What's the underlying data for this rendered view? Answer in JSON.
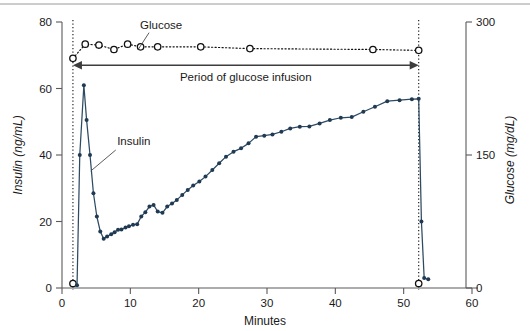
{
  "chart_data": {
    "type": "line",
    "title": "",
    "xlabel": "Minutes",
    "ylabel": "Insulin (ng/mL)",
    "y2label": "Glucose (mg/dL)",
    "xlim": [
      0,
      60
    ],
    "ylim": [
      0,
      80
    ],
    "y2lim": [
      0,
      300
    ],
    "grid": false,
    "legend_position": "inline-annotations",
    "xticks": [
      0,
      10,
      20,
      30,
      40,
      50,
      60
    ],
    "xtick_labels": [
      "0",
      "10",
      "20",
      "30",
      "40",
      "50",
      "60"
    ],
    "yticks": [
      0,
      20,
      40,
      60,
      80
    ],
    "ytick_labels": [
      "0",
      "20",
      "40",
      "60",
      "80"
    ],
    "y2ticks": [
      0,
      150,
      300
    ],
    "y2tick_labels": [
      "0",
      "150",
      "300"
    ],
    "series": [
      {
        "name": "Insulin",
        "axis": "left",
        "units": "ng/mL",
        "color": "#2d4a63",
        "marker": "filled-circle",
        "x": [
          2.2,
          2.6,
          3.2,
          3.6,
          4.1,
          4.6,
          5.1,
          5.6,
          6.1,
          6.6,
          7.2,
          7.7,
          8.2,
          8.7,
          9.3,
          9.8,
          10.4,
          11.0,
          11.6,
          12.2,
          12.8,
          13.4,
          14.0,
          14.7,
          15.4,
          16.1,
          16.8,
          17.6,
          18.4,
          19.2,
          20.1,
          21.0,
          22.0,
          23.0,
          24.0,
          25.1,
          26.2,
          27.3,
          28.4,
          29.6,
          30.8,
          32.1,
          33.4,
          34.8,
          36.2,
          37.7,
          39.2,
          40.8,
          42.4,
          44.1,
          45.8,
          47.6,
          49.4,
          51.2,
          52.2,
          52.6,
          53.0,
          53.6
        ],
        "y": [
          0.8,
          40.0,
          61.0,
          50.5,
          40.0,
          28.5,
          21.5,
          17.0,
          14.8,
          15.5,
          16.2,
          16.8,
          17.5,
          17.6,
          18.2,
          18.6,
          19.0,
          19.2,
          21.5,
          22.8,
          24.5,
          25.0,
          23.0,
          22.6,
          24.5,
          25.4,
          26.5,
          28.0,
          29.5,
          30.8,
          32.0,
          33.5,
          35.5,
          37.5,
          39.5,
          41.0,
          42.0,
          43.5,
          45.5,
          45.8,
          46.2,
          47.0,
          48.0,
          48.5,
          48.6,
          49.5,
          50.5,
          51.2,
          51.4,
          53.0,
          54.5,
          56.2,
          56.5,
          56.8,
          56.9,
          20.0,
          3.0,
          2.6
        ]
      },
      {
        "name": "Glucose",
        "axis": "right",
        "units": "mg/dL",
        "color": "#111111",
        "marker": "open-circle",
        "x": [
          1.6,
          1.6,
          3.4,
          5.4,
          7.6,
          9.6,
          11.5,
          14.0,
          20.3,
          27.5,
          45.5,
          52.2,
          52.2
        ],
        "y": [
          5,
          259,
          275,
          274,
          269,
          275,
          272,
          272,
          272,
          270,
          269,
          268,
          5
        ]
      }
    ],
    "annotations": [
      {
        "id": "glucose-series-label",
        "text": "Glucose",
        "x_min": 14.5,
        "y_left": 78.0
      },
      {
        "id": "insulin-series-label",
        "text": "Insulin",
        "x_min": 10.5,
        "y_left": 43.0
      },
      {
        "id": "infusion-period",
        "text": "Period of glucose infusion",
        "x_start_min": 1.6,
        "x_end_min": 52.2,
        "y_left": 67.0,
        "style": "double-headed-arrow"
      }
    ],
    "vertical_markers": [
      {
        "id": "infusion-start",
        "x_min": 1.6,
        "style": "dotted"
      },
      {
        "id": "infusion-end",
        "x_min": 52.2,
        "style": "dotted"
      }
    ]
  },
  "colors": {
    "insulin": "#2d4a63",
    "glucose": "#111111",
    "axis": "#5a5a5a",
    "annotation": "#3d3d3d",
    "background": "#ffffff"
  }
}
